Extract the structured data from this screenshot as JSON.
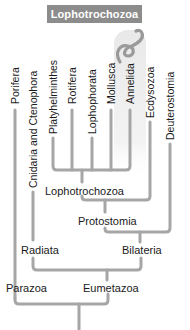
{
  "header": {
    "title": "Lophotrochozoa"
  },
  "colors": {
    "header_bg": "#8c8c8c",
    "branch": "#a6a6a6",
    "highlight": "#ececec",
    "worm": "#9a9a9a"
  },
  "taxa": [
    {
      "label": "Porifera"
    },
    {
      "label": "Cnidaria and Ctenophora"
    },
    {
      "label": "Platyhelminthes"
    },
    {
      "label": "Rotifera"
    },
    {
      "label": "Lophophorata"
    },
    {
      "label": "Mollusca"
    },
    {
      "label": "Annelida"
    },
    {
      "label": "Ecdysozoa"
    },
    {
      "label": "Deuterostomia"
    }
  ],
  "clades": {
    "lophotrochozoa": "Lophotrochozoa",
    "protostomia": "Protostomia",
    "bilateria": "Bilateria",
    "radiata": "Radiata",
    "eumetazoa": "Eumetazoa",
    "parazoa": "Parazoa"
  },
  "illustration": {
    "icon": "worm-icon",
    "highlighted_taxon": "Annelida"
  }
}
